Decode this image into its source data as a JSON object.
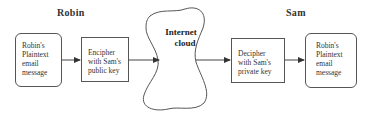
{
  "diagram": {
    "sender": {
      "label": "Robin"
    },
    "receiver": {
      "label": "Sam"
    },
    "nodes": [
      {
        "id": "plaintext-source",
        "lines": [
          "Robin's",
          "Plaintext",
          "email",
          "message"
        ],
        "shape": "rounded-rect"
      },
      {
        "id": "encipher",
        "lines": [
          "Encipher",
          "with Sam's",
          "public key"
        ],
        "shape": "rect"
      },
      {
        "id": "internet-cloud",
        "lines": [
          "Internet",
          "cloud"
        ],
        "shape": "cloud"
      },
      {
        "id": "decipher",
        "lines": [
          "Decipher",
          "with Sam's",
          "private key"
        ],
        "shape": "rect"
      },
      {
        "id": "plaintext-dest",
        "lines": [
          "Robin's",
          "Plaintext",
          "email",
          "message"
        ],
        "shape": "rounded-rect"
      }
    ],
    "edges": [
      {
        "from": "plaintext-source",
        "to": "encipher"
      },
      {
        "from": "encipher",
        "to": "internet-cloud"
      },
      {
        "from": "internet-cloud",
        "to": "decipher"
      },
      {
        "from": "decipher",
        "to": "plaintext-dest"
      }
    ],
    "colors": {
      "stroke": "#555555",
      "text": "#333333",
      "background": "#ffffff"
    }
  }
}
